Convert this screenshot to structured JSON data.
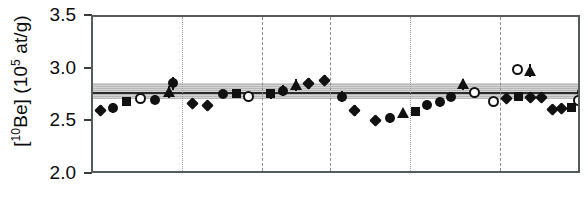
{
  "chart_data": {
    "type": "scatter",
    "title": "",
    "xlabel": "",
    "ylabel_text": "[10Be] (105 at/g)",
    "ylabel_parts": {
      "prefix": "[",
      "sup1": "10",
      "mid": "Be] (10",
      "sup2": "5",
      "suffix": " at/g)"
    },
    "ylim": [
      2.0,
      3.5
    ],
    "yticks": [
      2.0,
      2.5,
      3.0,
      3.5
    ],
    "ytick_labels": [
      "2.0",
      "2.5",
      "3.0",
      "3.5"
    ],
    "xlim": [
      0,
      100
    ],
    "xticks": [],
    "xtick_labels": [],
    "grid": "vertical-only",
    "legend": "none",
    "reference_band": {
      "label": "mean with uncertainty envelope",
      "mean": 2.78,
      "lower": 2.72,
      "upper": 2.87,
      "fill_color": "#b9b9b9",
      "line_color": "#2b2b2b"
    },
    "vertical_separators": [
      {
        "x": 18.2,
        "style": "dotted"
      },
      {
        "x": 34.6,
        "style": "dashed"
      },
      {
        "x": 48.5,
        "style": "dashed"
      },
      {
        "x": 64.8,
        "style": "dotted"
      },
      {
        "x": 83.2,
        "style": "dashed"
      }
    ],
    "marker_colors": {
      "filled": "#111111",
      "open_fill": "#ffffff",
      "open_edge": "#111111"
    },
    "points": [
      {
        "x": 1.6,
        "y": 2.615,
        "err": 0.045,
        "marker": "diamond"
      },
      {
        "x": 4.1,
        "y": 2.635,
        "err": 0.045,
        "marker": "circle"
      },
      {
        "x": 6.9,
        "y": 2.7,
        "err": 0.04,
        "marker": "square"
      },
      {
        "x": 9.8,
        "y": 2.725,
        "err": 0.04,
        "marker": "circle-open"
      },
      {
        "x": 12.7,
        "y": 2.715,
        "err": 0.045,
        "marker": "circle"
      },
      {
        "x": 15.5,
        "y": 2.79,
        "err": 0.055,
        "marker": "triangle"
      },
      {
        "x": 16.4,
        "y": 2.87,
        "err": 0.06,
        "marker": "circle"
      },
      {
        "x": 20.4,
        "y": 2.68,
        "err": 0.045,
        "marker": "diamond"
      },
      {
        "x": 23.5,
        "y": 2.66,
        "err": 0.045,
        "marker": "diamond"
      },
      {
        "x": 26.6,
        "y": 2.77,
        "err": 0.04,
        "marker": "circle"
      },
      {
        "x": 29.4,
        "y": 2.775,
        "err": 0.04,
        "marker": "square"
      },
      {
        "x": 31.9,
        "y": 2.75,
        "err": 0.04,
        "marker": "circle-open"
      },
      {
        "x": 36.4,
        "y": 2.77,
        "err": 0.045,
        "marker": "square"
      },
      {
        "x": 38.9,
        "y": 2.8,
        "err": 0.05,
        "marker": "circle"
      },
      {
        "x": 41.5,
        "y": 2.855,
        "err": 0.055,
        "marker": "triangle"
      },
      {
        "x": 44.1,
        "y": 2.87,
        "err": 0.055,
        "marker": "diamond"
      },
      {
        "x": 47.4,
        "y": 2.9,
        "err": 0.05,
        "marker": "diamond"
      },
      {
        "x": 50.9,
        "y": 2.745,
        "err": 0.05,
        "marker": "circle"
      },
      {
        "x": 53.5,
        "y": 2.61,
        "err": 0.05,
        "marker": "diamond"
      },
      {
        "x": 57.8,
        "y": 2.515,
        "err": 0.045,
        "marker": "diamond"
      },
      {
        "x": 60.7,
        "y": 2.54,
        "err": 0.045,
        "marker": "circle"
      },
      {
        "x": 63.4,
        "y": 2.585,
        "err": 0.04,
        "marker": "triangle"
      },
      {
        "x": 65.9,
        "y": 2.6,
        "err": 0.04,
        "marker": "square"
      },
      {
        "x": 68.4,
        "y": 2.66,
        "err": 0.045,
        "marker": "circle"
      },
      {
        "x": 70.9,
        "y": 2.69,
        "err": 0.045,
        "marker": "circle"
      },
      {
        "x": 73.3,
        "y": 2.745,
        "err": 0.045,
        "marker": "circle"
      },
      {
        "x": 75.6,
        "y": 2.86,
        "err": 0.05,
        "marker": "triangle"
      },
      {
        "x": 78.1,
        "y": 2.78,
        "err": 0.045,
        "marker": "circle-open"
      },
      {
        "x": 81.9,
        "y": 2.7,
        "err": 0.045,
        "marker": "circle-open"
      },
      {
        "x": 84.6,
        "y": 2.73,
        "err": 0.045,
        "marker": "diamond"
      },
      {
        "x": 87.0,
        "y": 2.745,
        "err": 0.045,
        "marker": "square"
      },
      {
        "x": 89.4,
        "y": 2.74,
        "err": 0.045,
        "marker": "diamond"
      },
      {
        "x": 91.8,
        "y": 2.74,
        "err": 0.045,
        "marker": "diamond"
      },
      {
        "x": 86.9,
        "y": 3.0,
        "err": 0.045,
        "marker": "circle-open"
      },
      {
        "x": 89.3,
        "y": 2.99,
        "err": 0.06,
        "marker": "triangle"
      },
      {
        "x": 93.9,
        "y": 2.62,
        "err": 0.045,
        "marker": "diamond"
      },
      {
        "x": 95.9,
        "y": 2.63,
        "err": 0.045,
        "marker": "diamond"
      },
      {
        "x": 97.8,
        "y": 2.64,
        "err": 0.04,
        "marker": "square"
      },
      {
        "x": 99.2,
        "y": 2.71,
        "err": 0.04,
        "marker": "circle-open"
      },
      {
        "x": 99.9,
        "y": 2.79,
        "err": 0.045,
        "marker": "circle"
      },
      {
        "x": 100.6,
        "y": 2.95,
        "err": 0.06,
        "marker": "triangle"
      }
    ]
  }
}
